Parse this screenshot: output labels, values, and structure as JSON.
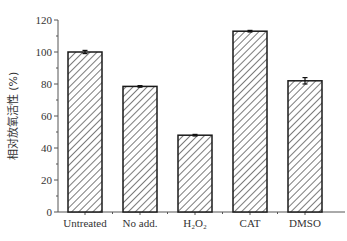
{
  "chart_data": {
    "type": "bar",
    "title": "",
    "xlabel": "",
    "ylabel": "相对放氧活性 (%)",
    "categories": [
      "Untreated",
      "No add.",
      "H₂O₂",
      "CAT",
      "DMSO"
    ],
    "values": [
      100,
      78.5,
      48,
      113,
      82
    ],
    "errors": [
      1.0,
      0.5,
      0.5,
      0.5,
      2.0
    ],
    "ylim": [
      0,
      120
    ],
    "yticks": [
      0,
      20,
      40,
      60,
      80,
      100,
      120
    ],
    "grid": false,
    "legend": null,
    "bar_style": "diagonal hatch, black outline, white fill"
  },
  "colors": {
    "bar_outline": "#1a1a1a",
    "hatch": "#333333",
    "axis": "#555555"
  }
}
